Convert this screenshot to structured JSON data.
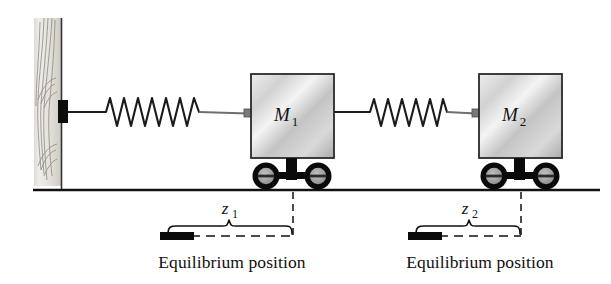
{
  "figure": {
    "type": "physics-schematic",
    "background_color": "#ffffff",
    "line_color": "#111111"
  },
  "wall": {
    "name": "fixed-wall",
    "texture": "wood-grain",
    "fill_light": "#e9e7e4",
    "fill_dark": "#cfcbc6",
    "grain_color": "#8c8880",
    "x": 34,
    "y": 18,
    "width": 28,
    "height": 168
  },
  "wall_anchor": {
    "name": "wall-anchor-block",
    "color": "#0d0d0d",
    "x": 58,
    "y": 99,
    "width": 10,
    "height": 22
  },
  "ground": {
    "name": "ground-line",
    "color": "#111111",
    "y": 190,
    "x_start": 33,
    "x_end": 600,
    "thickness": 2.6
  },
  "springs": [
    {
      "name": "spring-1",
      "label": "k1",
      "coils": 7,
      "x_start": 68,
      "x_end": 250,
      "y": 112,
      "amplitude": 15,
      "color": "#1a1a1a"
    },
    {
      "name": "spring-2",
      "label": "k2",
      "coils": 6,
      "x_start": 338,
      "x_end": 478,
      "y": 112,
      "amplitude": 14,
      "color": "#1a1a1a"
    }
  ],
  "blocks": [
    {
      "name": "mass-block-1",
      "label": "M",
      "subscript": "1",
      "x": 251,
      "y": 74,
      "width": 83,
      "height": 84,
      "fill_light": "#f2f2f2",
      "fill_mid": "#c9c9c9",
      "fill_dark": "#a8a8a8",
      "border_color": "#2a2a2a"
    },
    {
      "name": "mass-block-2",
      "label": "M",
      "subscript": "2",
      "x": 479,
      "y": 74,
      "width": 83,
      "height": 84,
      "fill_light": "#f2f2f2",
      "fill_mid": "#c9c9c9",
      "fill_dark": "#a8a8a8",
      "border_color": "#2a2a2a"
    }
  ],
  "wheels": [
    {
      "name": "wheel-assembly-1",
      "center_x": 292,
      "axle_y": 177,
      "wheel_radius": 12,
      "wheel_offset": 26,
      "tire_color": "#0a0a0a",
      "hub_color": "#9a9a9a"
    },
    {
      "name": "wheel-assembly-2",
      "center_x": 520,
      "axle_y": 177,
      "wheel_radius": 12,
      "wheel_offset": 26,
      "tire_color": "#0a0a0a",
      "hub_color": "#9a9a9a"
    }
  ],
  "dimensions": [
    {
      "name": "displacement-z1",
      "label": "z",
      "subscript": "1",
      "marker_x": 160,
      "marker_y": 232,
      "marker_width": 32,
      "marker_height": 8,
      "brace_x_start": 168,
      "brace_x_end": 293,
      "brace_y": 226,
      "dash_x_start": 176,
      "dash_x_end": 293,
      "dash_y": 236,
      "drop_x": 293,
      "drop_y_start": 192,
      "drop_y_end": 236,
      "label_x": 228,
      "label_y": 214,
      "caption": "Equilibrium position",
      "caption_x": 232,
      "caption_y": 268
    },
    {
      "name": "displacement-z2",
      "label": "z",
      "subscript": "2",
      "marker_x": 408,
      "marker_y": 232,
      "marker_width": 32,
      "marker_height": 8,
      "brace_x_start": 416,
      "brace_x_end": 521,
      "brace_y": 226,
      "dash_x_start": 424,
      "dash_x_end": 521,
      "dash_y": 236,
      "drop_x": 521,
      "drop_y_start": 192,
      "drop_y_end": 236,
      "label_x": 468,
      "label_y": 214,
      "caption": "Equilibrium position",
      "caption_x": 480,
      "caption_y": 268
    }
  ]
}
